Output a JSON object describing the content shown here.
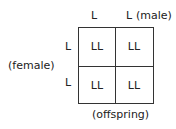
{
  "punnett": {
    "male_alleles": [
      "L",
      "L"
    ],
    "male_label": "(male)",
    "female_alleles": [
      "L",
      "L"
    ],
    "female_label": "(female)",
    "cells": [
      [
        "LL",
        "LL"
      ],
      [
        "LL",
        "LL"
      ]
    ],
    "offspring_label": "(offspring)"
  }
}
